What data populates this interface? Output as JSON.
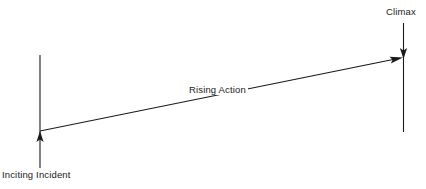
{
  "diagram": {
    "type": "story-structure-arc",
    "background_color": "#ffffff",
    "stroke_color": "#1a1a1a",
    "text_color": "#1a1a1a",
    "labels": {
      "inciting_incident": "Inciting Incident",
      "rising_action": "Rising Action",
      "climax": "Climax"
    },
    "elements": [
      {
        "name": "inciting-incident-axis",
        "kind": "vertical-line-with-up-arrow",
        "x": 40,
        "y_top": 55,
        "y_bottom": 168,
        "arrow_tip_y": 132,
        "arrow_direction": "up"
      },
      {
        "name": "rising-action-arrow",
        "kind": "diagonal-line-with-right-arrow",
        "x_start": 40,
        "y_start": 131,
        "x_end": 402,
        "y_end": 58,
        "arrow_direction": "up-right"
      },
      {
        "name": "climax-axis",
        "kind": "vertical-line-with-down-arrow",
        "x": 403,
        "y_top": 23,
        "y_bottom": 132,
        "arrow_tip_y": 58,
        "arrow_direction": "down"
      }
    ]
  }
}
